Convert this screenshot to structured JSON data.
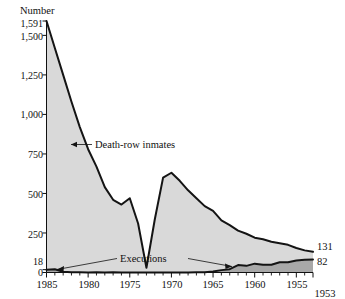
{
  "chart_data": {
    "type": "area",
    "title": "",
    "ylabel": "Number",
    "xlabel": "",
    "grid": false,
    "legend_position": "inline-annotations",
    "x_axis_reversed": true,
    "xlim": [
      1953,
      1985
    ],
    "ylim": [
      0,
      1591
    ],
    "x_tick_labels": [
      "1985",
      "1980",
      "1975",
      "1970",
      "1965",
      "1960",
      "1955",
      "1953"
    ],
    "x_ticks": [
      1985,
      1980,
      1975,
      1970,
      1965,
      1960,
      1955,
      1953
    ],
    "y_tick_labels": [
      "1,591",
      "1,500",
      "1,250",
      "1,000",
      "750",
      "500",
      "250",
      "18",
      "0"
    ],
    "y_ticks": [
      1591,
      1500,
      1250,
      1000,
      750,
      500,
      250,
      18,
      0
    ],
    "end_labels": [
      {
        "text": "131",
        "series": "Death-row inmates",
        "value": 131
      },
      {
        "text": "82",
        "series": "Executions",
        "value": 82
      }
    ],
    "annotations": [
      {
        "text": "Death-row inmates",
        "series": "Death-row inmates"
      },
      {
        "text": "Executions",
        "series": "Executions"
      }
    ],
    "fill_color_inmates": "#d9d9d9",
    "fill_color_executions": "#a8a8a8",
    "line_color": "#141414",
    "series": [
      {
        "name": "Death-row inmates",
        "x": [
          1985,
          1984,
          1983,
          1982,
          1981,
          1980,
          1979,
          1978,
          1977,
          1976,
          1975,
          1974,
          1973,
          1972,
          1971,
          1970,
          1969,
          1968,
          1967,
          1966,
          1965,
          1964,
          1963,
          1962,
          1961,
          1960,
          1959,
          1958,
          1957,
          1956,
          1955,
          1954,
          1953
        ],
        "values": [
          1591,
          1420,
          1250,
          1080,
          920,
          780,
          670,
          540,
          460,
          430,
          470,
          310,
          30,
          335,
          600,
          631,
          580,
          520,
          470,
          420,
          390,
          330,
          300,
          265,
          245,
          220,
          210,
          195,
          185,
          175,
          155,
          140,
          131
        ]
      },
      {
        "name": "Executions",
        "x": [
          1985,
          1984,
          1983,
          1982,
          1981,
          1980,
          1979,
          1978,
          1977,
          1976,
          1975,
          1974,
          1973,
          1972,
          1971,
          1970,
          1969,
          1968,
          1967,
          1966,
          1965,
          1964,
          1963,
          1962,
          1961,
          1960,
          1959,
          1958,
          1957,
          1956,
          1955,
          1954,
          1953
        ],
        "values": [
          18,
          21,
          5,
          2,
          1,
          0,
          2,
          0,
          1,
          0,
          0,
          0,
          0,
          0,
          0,
          0,
          0,
          0,
          2,
          1,
          7,
          15,
          21,
          47,
          42,
          56,
          49,
          49,
          65,
          65,
          76,
          81,
          82
        ]
      }
    ]
  },
  "labels": {
    "y_axis_title": "Number",
    "annotation_inmates": "Death-row inmates",
    "annotation_executions": "Executions",
    "end_label_top": "131",
    "end_label_bottom": "82",
    "y_1591": "1,591",
    "y_1500": "1,500",
    "y_1250": "1,250",
    "y_1000": "1,000",
    "y_750": "750",
    "y_500": "500",
    "y_250": "250",
    "y_18": "18",
    "y_0": "0",
    "x_1985": "1985",
    "x_1980": "1980",
    "x_1975": "1975",
    "x_1970": "1970",
    "x_1965": "1965",
    "x_1960": "1960",
    "x_1955": "1955",
    "x_1953": "1953"
  }
}
